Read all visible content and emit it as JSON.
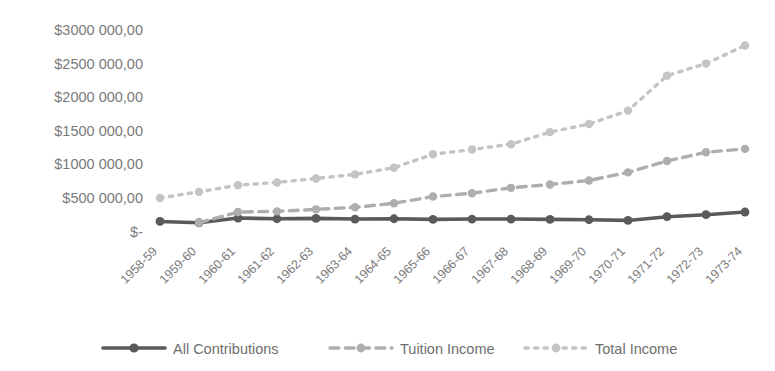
{
  "chart_data": {
    "type": "line",
    "title": "",
    "xlabel": "",
    "ylabel": "",
    "grid": false,
    "legend_position": "bottom",
    "ylim": [
      0,
      3000000
    ],
    "ytick_values": [
      0,
      500000,
      1000000,
      1500000,
      2000000,
      2500000,
      3000000
    ],
    "ytick_labels": [
      "$-",
      "$500 000,00",
      "$1000 000,00",
      "$1500 000,00",
      "$2000 000,00",
      "$2500 000,00",
      "$3000 000,00"
    ],
    "categories": [
      "1958-59",
      "1959-60",
      "1960-61",
      "1961-62",
      "1962-63",
      "1963-64",
      "1964-65",
      "1965-66",
      "1966-67",
      "1967-68",
      "1968-69",
      "1969-70",
      "1970-71",
      "1971-72",
      "1972-73",
      "1973-74"
    ],
    "series": [
      {
        "name": "All Contributions",
        "color": "#5a5a5a",
        "dash": "none",
        "marker": "circle",
        "values": [
          150000,
          130000,
          200000,
          190000,
          195000,
          185000,
          190000,
          180000,
          185000,
          185000,
          180000,
          175000,
          165000,
          220000,
          250000,
          290000
        ]
      },
      {
        "name": "Tuition Income",
        "color": "#aeaeae",
        "dash": "dashed",
        "marker": "circle",
        "values": [
          null,
          130000,
          290000,
          300000,
          330000,
          360000,
          420000,
          520000,
          570000,
          650000,
          700000,
          760000,
          880000,
          1050000,
          1180000,
          1230000
        ]
      },
      {
        "name": "Total Income",
        "color": "#c4c4c4",
        "dash": "dotted",
        "marker": "circle",
        "values": [
          500000,
          590000,
          690000,
          730000,
          790000,
          850000,
          950000,
          1150000,
          1220000,
          1300000,
          1480000,
          1600000,
          1800000,
          2320000,
          2500000,
          2770000
        ]
      }
    ]
  },
  "legend": {
    "items": [
      {
        "label": "All Contributions"
      },
      {
        "label": "Tuition Income"
      },
      {
        "label": "Total Income"
      }
    ]
  }
}
